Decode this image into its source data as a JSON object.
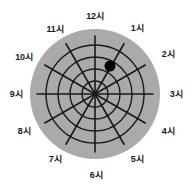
{
  "figure": {
    "name": "clock-direction-polar-diagram"
  },
  "colors": {
    "disc_fill": "#aaaaaa",
    "grid_stroke": "#1a1a1a",
    "marker_fill": "#000000",
    "label_text": "#1a1a1a",
    "background": "#ffffff"
  },
  "chart_data": {
    "type": "scatter",
    "title": "",
    "subtitle": "",
    "xlabel": "",
    "ylabel": "",
    "coordinate_system": "polar",
    "grid": true,
    "legend": false,
    "angular_axis": {
      "unit": "clock-hour",
      "tick_count": 12,
      "tick_labels": [
        "12시",
        "1시",
        "2시",
        "3시",
        "4시",
        "5시",
        "6시",
        "7시",
        "8시",
        "9시",
        "10시",
        "11시"
      ],
      "tick_angles_deg": [
        0,
        30,
        60,
        90,
        120,
        150,
        180,
        210,
        240,
        270,
        300,
        330
      ],
      "zero_at": "top",
      "direction": "clockwise"
    },
    "radial_axis": {
      "ring_count": 4,
      "ring_radii_px": [
        13,
        25,
        37,
        49
      ],
      "spoke_radius_px": 58,
      "disc_radius_px": 65,
      "range": [
        0,
        4
      ]
    },
    "center_px": {
      "x": 95,
      "y": 94
    },
    "points": [
      {
        "label": "marker-1",
        "hour": 1.5,
        "angle_deg": 45,
        "radius": 3,
        "x_px": 110,
        "y_px": 66,
        "size_px": 11,
        "color": "#000000"
      }
    ]
  },
  "labels": [
    {
      "name": "hour-label-12",
      "text": "12시",
      "x": 95,
      "y": 16
    },
    {
      "name": "hour-label-1",
      "text": "1시",
      "x": 137,
      "y": 28
    },
    {
      "name": "hour-label-2",
      "text": "2시",
      "x": 168,
      "y": 54
    },
    {
      "name": "hour-label-3",
      "text": "3시",
      "x": 176,
      "y": 94
    },
    {
      "name": "hour-label-4",
      "text": "4시",
      "x": 168,
      "y": 131
    },
    {
      "name": "hour-label-5",
      "text": "5시",
      "x": 137,
      "y": 159
    },
    {
      "name": "hour-label-6",
      "text": "6시",
      "x": 96,
      "y": 175
    },
    {
      "name": "hour-label-7",
      "text": "7시",
      "x": 55,
      "y": 159
    },
    {
      "name": "hour-label-8",
      "text": "8시",
      "x": 24,
      "y": 131
    },
    {
      "name": "hour-label-9",
      "text": "9시",
      "x": 16,
      "y": 94
    },
    {
      "name": "hour-label-10",
      "text": "10시",
      "x": 24,
      "y": 57
    },
    {
      "name": "hour-label-11",
      "text": "11시",
      "x": 55,
      "y": 29
    }
  ]
}
